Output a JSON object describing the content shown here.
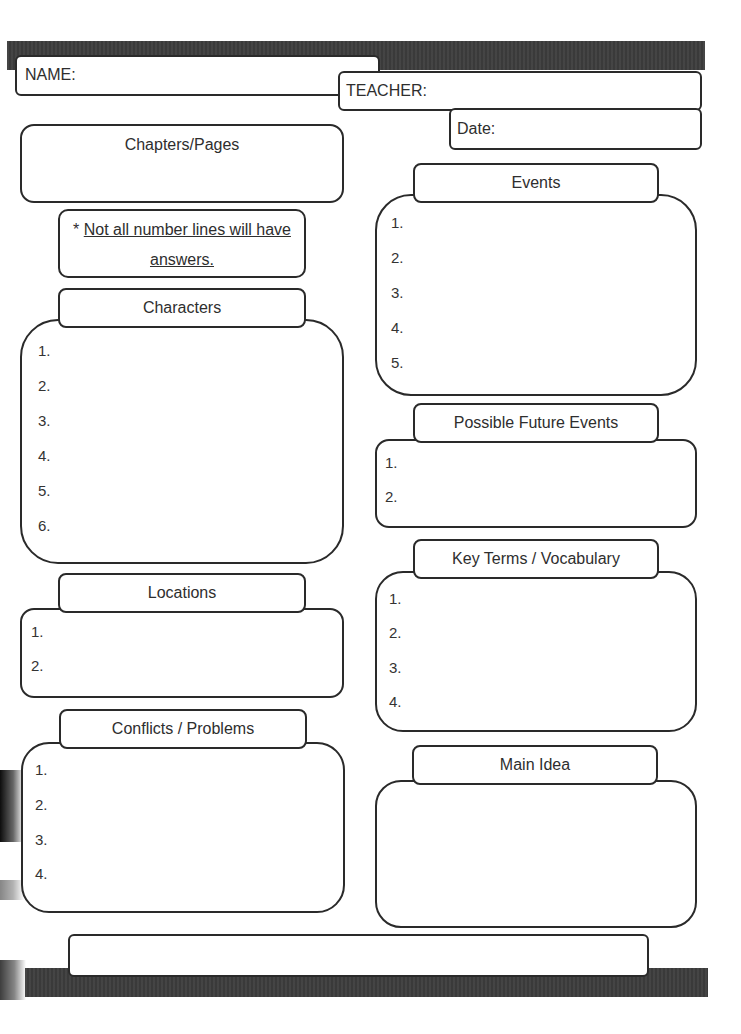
{
  "header": {
    "name_label": "NAME:",
    "teacher_label": "TEACHER:",
    "date_label": "Date:"
  },
  "chapters": {
    "title": "Chapters/Pages"
  },
  "note": {
    "prefix": "* ",
    "line1": "Not all number lines will have",
    "line2": "answers."
  },
  "characters": {
    "title": "Characters",
    "items": [
      "1.",
      "2.",
      "3.",
      "4.",
      "5.",
      "6."
    ]
  },
  "locations": {
    "title": "Locations",
    "items": [
      "1.",
      "2."
    ]
  },
  "conflicts": {
    "title": "Conflicts / Problems",
    "items": [
      "1.",
      "2.",
      "3.",
      "4."
    ]
  },
  "events": {
    "title": "Events",
    "items": [
      "1.",
      "2.",
      "3.",
      "4.",
      "5."
    ]
  },
  "future_events": {
    "title": "Possible Future Events",
    "items": [
      "1.",
      "2."
    ]
  },
  "key_terms": {
    "title": "Key Terms / Vocabulary",
    "items": [
      "1.",
      "2.",
      "3.",
      "4."
    ]
  },
  "main_idea": {
    "title": "Main Idea"
  },
  "colors": {
    "bar": "#3d3d3d",
    "border": "#2a2a2a",
    "text": "#2e2e2e",
    "background": "#ffffff"
  }
}
